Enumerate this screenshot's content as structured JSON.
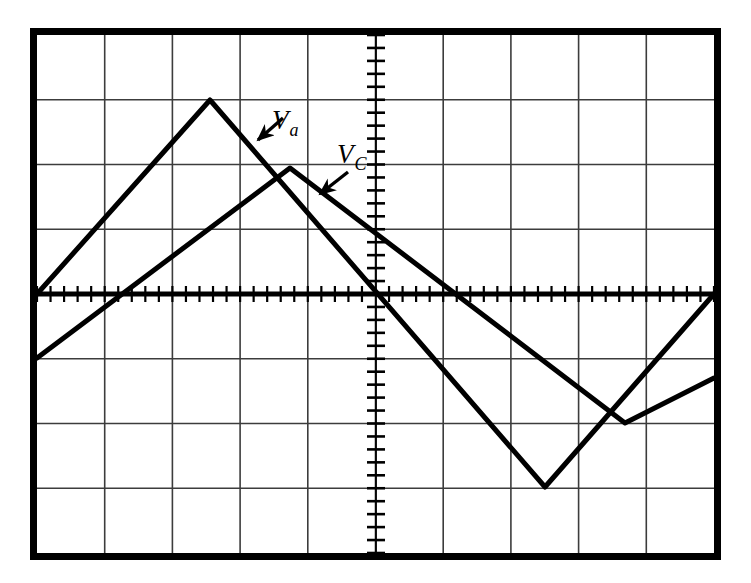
{
  "figure": {
    "background_color": "#ffffff",
    "trace_color": "#000000",
    "grid_color": "#3c3c3c",
    "border_color": "#000000"
  },
  "graticule": {
    "left": 37,
    "top": 35,
    "right": 714,
    "bottom": 553,
    "h_divisions": 10,
    "v_divisions": 8,
    "div_width": 67.7,
    "div_height": 64.75,
    "border_width": 7,
    "grid_line_width": 1.6,
    "center_axis_x": 376,
    "center_axis_y": 294,
    "subticks_per_division": 5,
    "x_tick_length": 8,
    "y_tick_length": 9,
    "x_axis_line_width": 5,
    "y_axis_line_width": 1.8
  },
  "annotations": [
    {
      "id": "va",
      "label_v": "V",
      "label_sub": "a",
      "label_x": 272,
      "label_y": 129,
      "arrow_from_x": 283,
      "arrow_from_y": 118,
      "arrow_to_x": 258,
      "arrow_to_y": 140
    },
    {
      "id": "vc",
      "label_v": "V",
      "label_sub": "C",
      "label_x": 337,
      "label_y": 163,
      "arrow_from_x": 348,
      "arrow_from_y": 172,
      "arrow_to_x": 320,
      "arrow_to_y": 194
    }
  ],
  "chart_data": {
    "type": "line",
    "xlabel": "",
    "ylabel": "",
    "grid": true,
    "legend": "inline-annotations",
    "axis_units": {
      "x": "divisions",
      "y": "divisions"
    },
    "xlim": [
      0,
      10
    ],
    "ylim": [
      -4,
      4
    ],
    "trace_width": 5,
    "series": [
      {
        "name": "Va",
        "label": "Va",
        "color": "#000000",
        "description": "Large-amplitude triangular wave, leading phase",
        "points_px": [
          [
            37,
            294
          ],
          [
            210,
            100
          ],
          [
            545,
            487
          ],
          [
            714,
            294
          ]
        ],
        "points_div": [
          [
            0.0,
            0.0
          ],
          [
            2.56,
            3.0
          ],
          [
            7.5,
            -2.98
          ],
          [
            10.0,
            0.0
          ]
        ]
      },
      {
        "name": "Vc",
        "label": "Vc",
        "color": "#000000",
        "description": "Smaller-amplitude triangular wave, lagging phase, rounded apexes",
        "points_px": [
          [
            37,
            358
          ],
          [
            290,
            168
          ],
          [
            625,
            423
          ],
          [
            714,
            378
          ]
        ],
        "points_div": [
          [
            0.0,
            -0.99
          ],
          [
            3.74,
            1.95
          ],
          [
            8.68,
            -1.99
          ],
          [
            10.0,
            -1.3
          ]
        ]
      }
    ]
  }
}
